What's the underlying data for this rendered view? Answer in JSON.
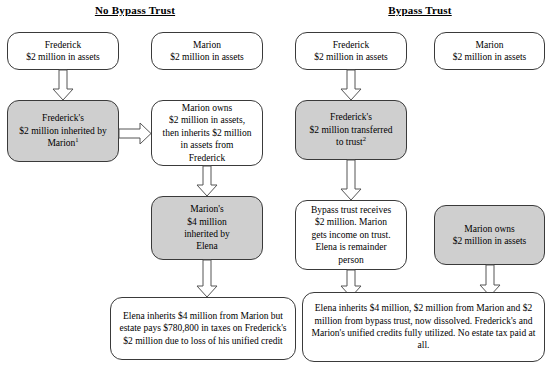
{
  "diagram": {
    "titles": {
      "left": "No Bypass Trust",
      "right": "Bypass Trust"
    },
    "colors": {
      "box_fill_highlight": "#cfcfcf",
      "box_fill_plain": "#ffffff",
      "box_border": "#3a3a3a",
      "arrow_stroke": "#555555",
      "text": "#000000"
    },
    "nodes": {
      "left_frederick_assets": "Frederick\n$2 million in assets",
      "left_marion_assets": "Marion\n$2 million in assets",
      "left_frederick_inherited_line1": "Frederick's",
      "left_frederick_inherited_line2": "$2 million inherited by",
      "left_frederick_inherited_line3": "Marion",
      "left_frederick_inherited_note": "1",
      "left_marion_owns": "Marion owns\n$2 million in assets,\nthen inherits $2 million\nin assets from\nFrederick",
      "left_marions_four_million": "Marion's\n$4 million\ninherited by\nElena",
      "left_outcome": "Elena inherits $4 million from Marion but estate pays $780,800 in taxes on Frederick's $2 million due to loss of his unified credit",
      "right_frederick_assets": "Frederick\n$2 million in assets",
      "right_marion_assets": "Marion\n$2 million in assets",
      "right_frederick_transferred_line1": "Frederick's",
      "right_frederick_transferred_line2": "$2 million transferred",
      "right_frederick_transferred_line3": "to trust",
      "right_frederick_transferred_note": "2",
      "right_bypass_trust_receives": "Bypass trust receives\n$2 million. Marion\ngets income on trust.\nElena is remainder\nperson",
      "right_marion_owns": "Marion owns\n$2 million in assets",
      "right_outcome": "Elena inherits $4  million, $2 million from Marion and $2 million from bypass trust, now dissolved.  Frederick's and Marion's unified credits fully  utilized. No estate tax paid at all."
    }
  }
}
